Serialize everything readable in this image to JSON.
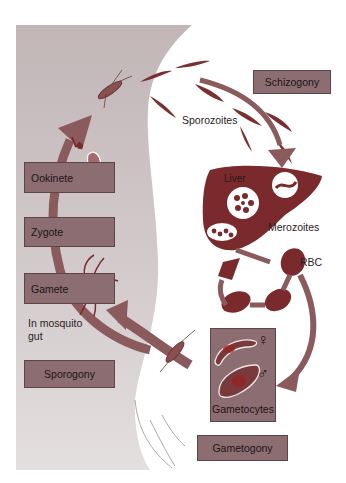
{
  "diagram": {
    "colors": {
      "background_panel": "#cbc1c2",
      "box_fill": "#8c6d71",
      "arrow": "#8a5a5c",
      "organ": "#7a2a2c",
      "text": "#1e1416"
    },
    "phases": {
      "schizogony": "Schizogony",
      "sporogony": "Sporogony",
      "gametogony": "Gametogony"
    },
    "stages": {
      "ookinete": "Ookinete",
      "zygote": "Zygote",
      "gamete": "Gamete",
      "gametocytes": "Gametocytes"
    },
    "labels": {
      "sporozoites": "Sporozoites",
      "liver": "Liver",
      "merozoites": "Merozoites",
      "rbc": "RBC",
      "mosquito_gut_line1": "In mosquito",
      "mosquito_gut_line2": "gut",
      "female_symbol": "♀",
      "male_symbol": "♂"
    }
  }
}
